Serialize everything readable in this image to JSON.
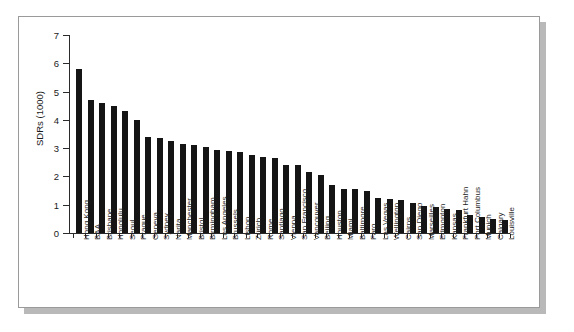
{
  "chart_data": {
    "type": "bar",
    "title": "",
    "xlabel": "",
    "ylabel": "SDRs (1000)",
    "ylim": [
      0,
      7
    ],
    "yticks": [
      0,
      1,
      2,
      3,
      4,
      5,
      6,
      7
    ],
    "ytick_labels": [
      "0",
      "1",
      "2",
      "3",
      "4",
      "5",
      "6",
      "7"
    ],
    "grid": false,
    "legend": false,
    "bar_color": "#151515",
    "axis_color": "#2b2b2b",
    "categories": [
      "Hong Kong",
      "BAA",
      "Brisbane",
      "Honolulu",
      "Seoul",
      "Prague",
      "Geneva",
      "Sydney",
      "Narita",
      "Manchester",
      "Bristol",
      "Birmingham",
      "Los Angeles",
      "Brussels",
      "Lisbon",
      "Zürich",
      "Rome",
      "Santiago",
      "Vienna",
      "San Francisco",
      "Vancouver",
      "Beijing",
      "Houston",
      "Miami",
      "Baltimore",
      "Faro",
      "Las Vegas",
      "Wellington",
      "Cairns",
      "San Diego",
      "Marseilles",
      "Edmonton",
      "Kansas",
      "Frankfurt Hahn",
      "Port Columbus",
      "Munich",
      "Calgary",
      "Louisville"
    ],
    "values": [
      5.8,
      4.7,
      4.6,
      4.5,
      4.3,
      4.0,
      3.4,
      3.35,
      3.25,
      3.15,
      3.1,
      3.05,
      2.95,
      2.9,
      2.85,
      2.75,
      2.7,
      2.65,
      2.4,
      2.4,
      2.15,
      2.05,
      1.7,
      1.55,
      1.55,
      1.5,
      1.25,
      1.2,
      1.15,
      1.05,
      0.95,
      0.92,
      0.85,
      0.8,
      0.62,
      0.55,
      0.5,
      0.45
    ]
  }
}
